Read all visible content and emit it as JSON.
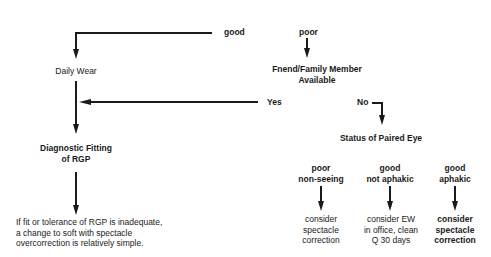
{
  "diagram": {
    "branches": {
      "good": "good",
      "poor": "poor",
      "yes": "Yes",
      "no": "No"
    },
    "nodes": {
      "daily_wear": "Daily Wear",
      "friend_family": "Fnend/Family Member\nAvailable",
      "diagnostic_fitting": "Diagnostic Fitting\nof RGP",
      "rgp_note": "If fit or tolerance of RGP is inadequate,\na change to soft with spectacle\novercorrection is relatively simple.",
      "status_paired_eye": "Status of Paired Eye"
    },
    "eye_status_options": [
      {
        "condition": "poor\nnon-seeing",
        "action": "consider\nspectacle\ncorrection"
      },
      {
        "condition": "good\nnot aphakic",
        "action": "consider EW\nin office, clean\nQ 30 days"
      },
      {
        "condition": "good\naphakic",
        "action": "consider\nspectacle\ncorrection"
      }
    ]
  }
}
